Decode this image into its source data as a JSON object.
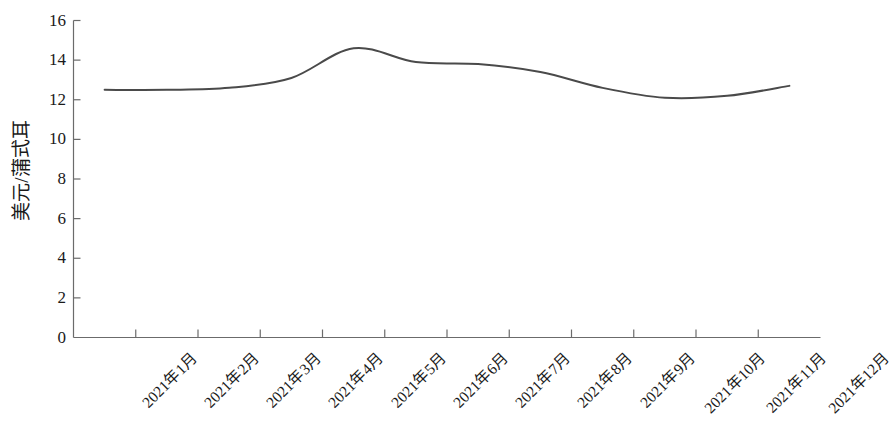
{
  "chart_data": {
    "type": "line",
    "title": "",
    "subtitle": "",
    "xlabel": "",
    "ylabel": "美元/蒲式耳",
    "categories": [
      "2021年1月",
      "2021年2月",
      "2021年3月",
      "2021年4月",
      "2021年5月",
      "2021年6月",
      "2021年7月",
      "2021年8月",
      "2021年9月",
      "2021年10月",
      "2021年11月",
      "2021年12月"
    ],
    "values": [
      12.5,
      12.5,
      12.6,
      13.1,
      14.6,
      13.9,
      13.8,
      13.4,
      12.6,
      12.1,
      12.2,
      12.7
    ],
    "series": [
      {
        "name": "美元/蒲式耳",
        "values": [
          12.5,
          12.5,
          12.6,
          13.1,
          14.6,
          13.9,
          13.8,
          13.4,
          12.6,
          12.1,
          12.2,
          12.7
        ]
      }
    ],
    "ylim": [
      0,
      16
    ],
    "yticks": [
      0,
      2,
      4,
      6,
      8,
      10,
      12,
      14,
      16
    ],
    "ytick_labels": [
      "0",
      "2",
      "4",
      "6",
      "8",
      "10",
      "12",
      "14",
      "16"
    ],
    "grid": false,
    "legend": false,
    "legend_position": "none",
    "line_color": "#4a4a4a",
    "axis_color": "#6b6b6b",
    "text_color": "#1a1a1a",
    "background_color": "#ffffff",
    "line_width": 2,
    "markers": false,
    "smoothing": true,
    "x_label_rotation": -45
  }
}
